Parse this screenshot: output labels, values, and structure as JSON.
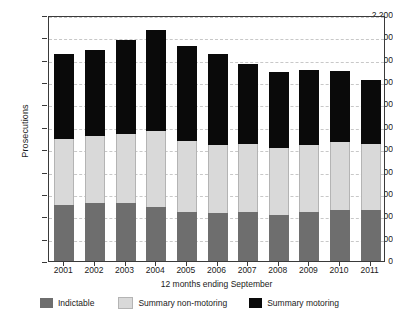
{
  "chart_data": {
    "type": "bar",
    "subtype": "stacked-vertical",
    "title": "",
    "xlabel": "12 months ending September",
    "ylabel": "Prosecutions",
    "categories": [
      "2001",
      "2002",
      "2003",
      "2004",
      "2005",
      "2006",
      "2007",
      "2008",
      "2009",
      "2010",
      "2011"
    ],
    "series": [
      {
        "name": "Indictable",
        "color": "#6e6e6e",
        "values": [
          500,
          515,
          520,
          480,
          435,
          425,
          435,
          410,
          435,
          455,
          455
        ]
      },
      {
        "name": "Summary non-motoring",
        "color": "#d9d9d9",
        "values": [
          595,
          600,
          620,
          680,
          635,
          615,
          610,
          600,
          605,
          605,
          590
        ]
      },
      {
        "name": "Summary motoring",
        "color": "#0a0a0a",
        "values": [
          760,
          775,
          835,
          910,
          855,
          815,
          715,
          680,
          665,
          640,
          570
        ]
      }
    ],
    "totals": [
      1855,
      1890,
      1975,
      2070,
      1925,
      1855,
      1760,
      1690,
      1705,
      1700,
      1615
    ],
    "ylim": [
      0,
      2200
    ],
    "ytick_step": 200,
    "yticks": [
      "0",
      "200",
      "400",
      "600",
      "800",
      "1,000",
      "1,200",
      "1,400",
      "1,600",
      "1,800",
      "2,000",
      "2,200"
    ],
    "grid": "horizontal-dashed",
    "legend_position": "bottom",
    "legend": [
      "Indictable",
      "Summary non-motoring",
      "Summary motoring"
    ]
  }
}
